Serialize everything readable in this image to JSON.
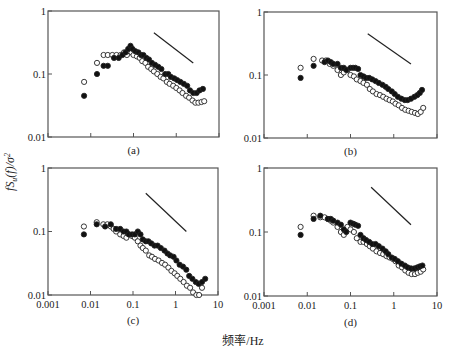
{
  "figure": {
    "ylabel": "fSᵤ(f)/σᵤ²",
    "ylabel_parts": {
      "f": "f",
      "S": "S",
      "sub": "u",
      "paren": "(f)/σ",
      "sup": "2"
    },
    "xlabel": "频率/Hz"
  },
  "chart_data": [
    {
      "type": "scatter",
      "panel_label": "(a)",
      "xscale": "log",
      "yscale": "log",
      "xlim": [
        0.001,
        10
      ],
      "ylim": [
        0.01,
        1
      ],
      "xticks": [
        "0.001",
        "0.01",
        "0.1",
        "1",
        "10"
      ],
      "yticks": [
        "0.01",
        "0.1",
        "1"
      ],
      "show_xtick_labels": false,
      "reference_line": {
        "x": [
          0.3,
          2.5
        ],
        "y": [
          0.45,
          0.15
        ],
        "note": "-2/3 slope guide"
      },
      "series": [
        {
          "name": "filled",
          "marker": "filled-circle",
          "x": [
            0.007,
            0.014,
            0.02,
            0.025,
            0.035,
            0.045,
            0.055,
            0.065,
            0.075,
            0.085,
            0.095,
            0.11,
            0.13,
            0.15,
            0.17,
            0.2,
            0.23,
            0.27,
            0.32,
            0.38,
            0.45,
            0.55,
            0.65,
            0.75,
            0.9,
            1.05,
            1.25,
            1.5,
            1.8,
            2.1,
            2.5,
            3.0,
            3.5,
            4.2
          ],
          "y": [
            0.045,
            0.1,
            0.135,
            0.135,
            0.18,
            0.18,
            0.2,
            0.22,
            0.25,
            0.28,
            0.25,
            0.23,
            0.22,
            0.2,
            0.2,
            0.18,
            0.17,
            0.15,
            0.14,
            0.13,
            0.12,
            0.1,
            0.1,
            0.09,
            0.085,
            0.08,
            0.075,
            0.07,
            0.065,
            0.055,
            0.05,
            0.05,
            0.055,
            0.058
          ]
        },
        {
          "name": "open",
          "marker": "open-circle",
          "x": [
            0.007,
            0.014,
            0.02,
            0.025,
            0.032,
            0.04,
            0.05,
            0.06,
            0.07,
            0.08,
            0.09,
            0.1,
            0.12,
            0.14,
            0.16,
            0.19,
            0.22,
            0.26,
            0.3,
            0.36,
            0.43,
            0.5,
            0.6,
            0.7,
            0.85,
            1.0,
            1.2,
            1.4,
            1.7,
            2.0,
            2.4,
            2.8,
            3.3,
            3.9,
            4.5
          ],
          "y": [
            0.075,
            0.15,
            0.2,
            0.2,
            0.2,
            0.2,
            0.2,
            0.22,
            0.2,
            0.23,
            0.22,
            0.2,
            0.19,
            0.18,
            0.16,
            0.15,
            0.13,
            0.12,
            0.11,
            0.1,
            0.09,
            0.085,
            0.075,
            0.07,
            0.065,
            0.06,
            0.055,
            0.05,
            0.045,
            0.042,
            0.038,
            0.035,
            0.035,
            0.036,
            0.037
          ]
        }
      ]
    },
    {
      "type": "scatter",
      "panel_label": "(b)",
      "xscale": "log",
      "yscale": "log",
      "xlim": [
        0.001,
        10
      ],
      "ylim": [
        0.01,
        1
      ],
      "xticks": [
        "0.001",
        "0.01",
        "0.1",
        "1",
        "10"
      ],
      "yticks": [
        "0.01",
        "0.1",
        "1"
      ],
      "show_xtick_labels": false,
      "reference_line": {
        "x": [
          0.25,
          2.5
        ],
        "y": [
          0.45,
          0.15
        ]
      },
      "series": [
        {
          "name": "filled",
          "marker": "filled-circle",
          "x": [
            0.007,
            0.014,
            0.025,
            0.03,
            0.035,
            0.04,
            0.05,
            0.06,
            0.07,
            0.08,
            0.1,
            0.115,
            0.13,
            0.15,
            0.17,
            0.2,
            0.23,
            0.27,
            0.32,
            0.38,
            0.45,
            0.55,
            0.65,
            0.75,
            0.9,
            1.05,
            1.25,
            1.5,
            1.8,
            2.1,
            2.5,
            3.0,
            3.5,
            4.0,
            4.5
          ],
          "y": [
            0.09,
            0.14,
            0.16,
            0.17,
            0.16,
            0.15,
            0.15,
            0.13,
            0.13,
            0.12,
            0.13,
            0.13,
            0.13,
            0.125,
            0.1,
            0.095,
            0.09,
            0.09,
            0.085,
            0.08,
            0.075,
            0.07,
            0.065,
            0.06,
            0.055,
            0.05,
            0.045,
            0.042,
            0.04,
            0.04,
            0.042,
            0.045,
            0.048,
            0.052,
            0.058
          ]
        },
        {
          "name": "open",
          "marker": "open-circle",
          "x": [
            0.007,
            0.014,
            0.022,
            0.027,
            0.033,
            0.04,
            0.05,
            0.06,
            0.07,
            0.085,
            0.1,
            0.12,
            0.14,
            0.17,
            0.2,
            0.24,
            0.28,
            0.33,
            0.4,
            0.48,
            0.57,
            0.68,
            0.8,
            0.95,
            1.1,
            1.3,
            1.55,
            1.85,
            2.2,
            2.6,
            3.1,
            3.6,
            4.2,
            4.8
          ],
          "y": [
            0.13,
            0.18,
            0.17,
            0.17,
            0.15,
            0.14,
            0.12,
            0.1,
            0.11,
            0.12,
            0.1,
            0.095,
            0.085,
            0.08,
            0.075,
            0.07,
            0.06,
            0.055,
            0.05,
            0.048,
            0.045,
            0.042,
            0.04,
            0.038,
            0.035,
            0.033,
            0.03,
            0.028,
            0.027,
            0.026,
            0.025,
            0.024,
            0.026,
            0.03
          ]
        }
      ]
    },
    {
      "type": "scatter",
      "panel_label": "(c)",
      "xscale": "log",
      "yscale": "log",
      "xlim": [
        0.001,
        10
      ],
      "ylim": [
        0.01,
        1
      ],
      "xticks": [
        "0.001",
        "0.01",
        "0.1",
        "1",
        "10"
      ],
      "yticks": [
        "0.01",
        "0.1",
        "1"
      ],
      "show_xtick_labels": true,
      "reference_line": {
        "x": [
          0.2,
          1.8
        ],
        "y": [
          0.4,
          0.1
        ]
      },
      "series": [
        {
          "name": "filled",
          "marker": "filled-circle",
          "x": [
            0.007,
            0.014,
            0.022,
            0.03,
            0.04,
            0.05,
            0.06,
            0.07,
            0.08,
            0.095,
            0.11,
            0.13,
            0.15,
            0.17,
            0.2,
            0.23,
            0.27,
            0.32,
            0.38,
            0.45,
            0.55,
            0.65,
            0.75,
            0.9,
            1.05,
            1.25,
            1.5,
            1.8,
            2.1,
            2.5,
            3.0,
            3.5,
            4.2,
            5.0
          ],
          "y": [
            0.09,
            0.13,
            0.12,
            0.13,
            0.11,
            0.11,
            0.1,
            0.1,
            0.09,
            0.09,
            0.09,
            0.1,
            0.09,
            0.075,
            0.07,
            0.07,
            0.065,
            0.06,
            0.06,
            0.055,
            0.05,
            0.045,
            0.042,
            0.04,
            0.035,
            0.03,
            0.028,
            0.025,
            0.02,
            0.018,
            0.016,
            0.015,
            0.016,
            0.018
          ]
        },
        {
          "name": "open",
          "marker": "open-circle",
          "x": [
            0.007,
            0.014,
            0.02,
            0.025,
            0.03,
            0.035,
            0.04,
            0.05,
            0.06,
            0.07,
            0.08,
            0.095,
            0.11,
            0.13,
            0.15,
            0.17,
            0.2,
            0.24,
            0.28,
            0.33,
            0.4,
            0.48,
            0.57,
            0.68,
            0.8,
            0.95,
            1.1,
            1.3,
            1.55,
            1.85,
            2.2,
            2.6,
            3.1,
            3.6,
            4.2
          ],
          "y": [
            0.12,
            0.14,
            0.13,
            0.13,
            0.12,
            0.11,
            0.1,
            0.09,
            0.085,
            0.08,
            0.09,
            0.085,
            0.08,
            0.07,
            0.06,
            0.055,
            0.05,
            0.042,
            0.04,
            0.037,
            0.035,
            0.032,
            0.03,
            0.027,
            0.024,
            0.022,
            0.02,
            0.018,
            0.016,
            0.014,
            0.013,
            0.011,
            0.01,
            0.01,
            0.013
          ]
        }
      ]
    },
    {
      "type": "scatter",
      "panel_label": "(d)",
      "xscale": "log",
      "yscale": "log",
      "xlim": [
        0.001,
        10
      ],
      "ylim": [
        0.01,
        1
      ],
      "xticks": [
        "0.001",
        "0.01",
        "0.1",
        "1",
        "10"
      ],
      "yticks": [
        "0.01",
        "0.1",
        "1"
      ],
      "show_xtick_labels": true,
      "reference_line": {
        "x": [
          0.3,
          2.5
        ],
        "y": [
          0.5,
          0.13
        ]
      },
      "series": [
        {
          "name": "filled",
          "marker": "filled-circle",
          "x": [
            0.007,
            0.014,
            0.02,
            0.03,
            0.035,
            0.04,
            0.05,
            0.06,
            0.07,
            0.08,
            0.1,
            0.115,
            0.13,
            0.15,
            0.17,
            0.2,
            0.23,
            0.27,
            0.32,
            0.38,
            0.45,
            0.55,
            0.65,
            0.75,
            0.9,
            1.05,
            1.25,
            1.5,
            1.8,
            2.1,
            2.5,
            3.0,
            3.5,
            4.0,
            4.6
          ],
          "y": [
            0.09,
            0.16,
            0.18,
            0.16,
            0.16,
            0.15,
            0.14,
            0.13,
            0.11,
            0.1,
            0.14,
            0.135,
            0.13,
            0.125,
            0.09,
            0.08,
            0.075,
            0.07,
            0.065,
            0.065,
            0.06,
            0.055,
            0.05,
            0.045,
            0.04,
            0.038,
            0.035,
            0.032,
            0.03,
            0.028,
            0.027,
            0.027,
            0.028,
            0.029,
            0.03
          ]
        },
        {
          "name": "open",
          "marker": "open-circle",
          "x": [
            0.007,
            0.014,
            0.02,
            0.025,
            0.03,
            0.035,
            0.04,
            0.05,
            0.06,
            0.07,
            0.085,
            0.1,
            0.12,
            0.14,
            0.17,
            0.2,
            0.24,
            0.28,
            0.33,
            0.4,
            0.48,
            0.57,
            0.68,
            0.8,
            0.95,
            1.1,
            1.3,
            1.55,
            1.85,
            2.2,
            2.6,
            3.1,
            3.6,
            4.2,
            4.8
          ],
          "y": [
            0.12,
            0.18,
            0.17,
            0.17,
            0.16,
            0.15,
            0.14,
            0.12,
            0.1,
            0.09,
            0.12,
            0.11,
            0.1,
            0.08,
            0.07,
            0.07,
            0.065,
            0.06,
            0.055,
            0.05,
            0.047,
            0.045,
            0.042,
            0.04,
            0.038,
            0.035,
            0.03,
            0.028,
            0.025,
            0.023,
            0.022,
            0.022,
            0.023,
            0.024,
            0.026
          ]
        }
      ]
    }
  ],
  "panels_layout": [
    {
      "left": 48,
      "top": 11,
      "right": 219,
      "bottom": 137,
      "label_y": 154
    },
    {
      "left": 264,
      "top": 12,
      "right": 437,
      "bottom": 138,
      "label_y": 155
    },
    {
      "left": 48,
      "top": 168,
      "right": 218,
      "bottom": 295,
      "label_y": 324
    },
    {
      "left": 264,
      "top": 168,
      "right": 437,
      "bottom": 296,
      "label_y": 326
    }
  ]
}
